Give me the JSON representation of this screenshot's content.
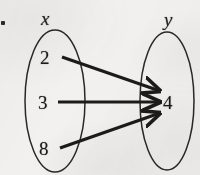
{
  "figure": {
    "type": "mapping-diagram",
    "background_color": "#f2f1ef",
    "ink_color": "#1d1b19",
    "bullet_marker": "▪",
    "domain_set": {
      "label": "x",
      "elements": [
        "2",
        "3",
        "8"
      ]
    },
    "codomain_set": {
      "label": "y",
      "elements": [
        "4"
      ]
    },
    "mappings": [
      {
        "from": "2",
        "to": "4"
      },
      {
        "from": "3",
        "to": "4"
      },
      {
        "from": "8",
        "to": "4"
      }
    ]
  },
  "geometry": {
    "left_ellipse": {
      "cx": 55,
      "cy": 101,
      "rx": 30,
      "ry": 71
    },
    "right_ellipse": {
      "cx": 167,
      "cy": 101,
      "rx": 27,
      "ry": 69
    },
    "label_x": {
      "x": 46,
      "y": 18,
      "text": "x"
    },
    "label_y": {
      "x": 168,
      "y": 20,
      "text": "y"
    },
    "elem_2": {
      "x": 45,
      "y": 57,
      "text": "2"
    },
    "elem_3": {
      "x": 43,
      "y": 102,
      "text": "3"
    },
    "elem_8": {
      "x": 44,
      "y": 148,
      "text": "8"
    },
    "elem_4": {
      "x": 168,
      "y": 102,
      "text": "4"
    },
    "arrows": [
      {
        "name": "arrow-2-to-4",
        "x1": 62,
        "y1": 57,
        "x2": 161,
        "y2": 91
      },
      {
        "name": "arrow-3-to-4",
        "x1": 58,
        "y1": 102,
        "x2": 161,
        "y2": 102
      },
      {
        "name": "arrow-8-to-4",
        "x1": 60,
        "y1": 148,
        "x2": 161,
        "y2": 113
      }
    ]
  }
}
